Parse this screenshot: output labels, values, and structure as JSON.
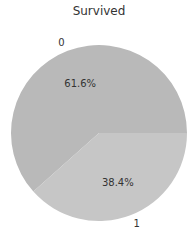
{
  "chart_data": {
    "type": "pie",
    "title": "Survived",
    "categories": [
      "0",
      "1"
    ],
    "values": [
      61.6,
      38.4
    ],
    "labels": [
      "61.6%",
      "38.4%"
    ],
    "colors": [
      "#b9b9b9",
      "#c6c6c6"
    ],
    "xlabel": "",
    "ylabel": "",
    "legend": "none",
    "start_angle_deg": 0,
    "direction": "counterclockwise"
  },
  "title": "Survived",
  "slices": [
    {
      "category": "0",
      "pct_label": "61.6%",
      "color": "#b9b9b9"
    },
    {
      "category": "1",
      "pct_label": "38.4%",
      "color": "#c6c6c6"
    }
  ]
}
